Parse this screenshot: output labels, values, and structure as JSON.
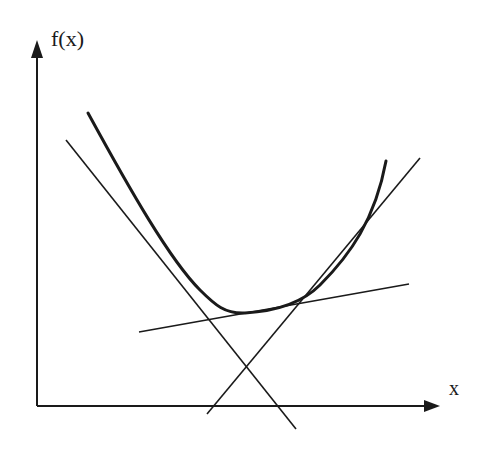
{
  "diagram": {
    "y_axis_label": "f(x)",
    "x_axis_label": "x",
    "colors": {
      "ink": "#1a1a1a",
      "background": "#ffffff"
    },
    "curve": "convex f(x) with minimum near bottom-center",
    "tangent_lines": [
      {
        "name": "left-tangent",
        "description": "steep negative slope tangent on left branch"
      },
      {
        "name": "bottom-tangent",
        "description": "shallow positive slope tangent near minimum"
      },
      {
        "name": "right-tangent",
        "description": "positive slope tangent on right branch"
      }
    ]
  }
}
